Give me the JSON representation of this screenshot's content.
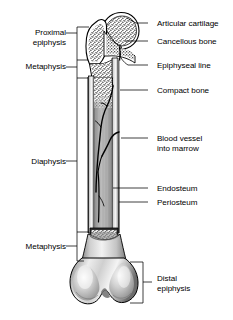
{
  "figure": {
    "width": 233,
    "height": 320,
    "background_color": "#ffffff",
    "ink_color": "#000000"
  },
  "labels_left": [
    {
      "id": "proximal-epiphysis",
      "line1": "Proximal",
      "line2": "epiphysis",
      "text_x": 71,
      "text_y": 28,
      "bracket": {
        "x": 77,
        "y_top": 27,
        "y_bottom": 60,
        "tick_y": 33,
        "tick_x2": 89
      }
    },
    {
      "id": "metaphysis-proximal",
      "line1": "Metaphysis",
      "line2": "",
      "text_x": 71,
      "text_y": 62,
      "bracket": {
        "x": 77,
        "y_top": 60,
        "y_bottom": 78,
        "tick_y": 67,
        "tick_x2": 88
      }
    },
    {
      "id": "diaphysis",
      "line1": "Diaphysis",
      "line2": "",
      "text_x": 71,
      "text_y": 157,
      "bracket": {
        "x": 77,
        "y_top": 78,
        "y_bottom": 232,
        "tick_y": 161,
        "tick_x2": 88
      }
    },
    {
      "id": "metaphysis-distal",
      "line1": "Metaphysis",
      "line2": "",
      "text_x": 71,
      "text_y": 242,
      "bracket": {
        "x": 77,
        "y_top": 232,
        "y_bottom": 261,
        "tick_y": 246,
        "tick_x2": 89
      }
    }
  ],
  "labels_right": [
    {
      "id": "articular-cartilage",
      "line1": "Articular cartilage",
      "line2": "",
      "text_x": 157,
      "text_y": 19,
      "leader": {
        "x1": 148,
        "y1": 23,
        "x2": 127,
        "y2": 19
      }
    },
    {
      "id": "cancellous-bone",
      "line1": "Cancellous bone",
      "line2": "",
      "text_x": 157,
      "text_y": 37,
      "leader": {
        "x1": 148,
        "y1": 41,
        "x2": 124,
        "y2": 41
      }
    },
    {
      "id": "epiphyseal-line",
      "line1": "Epiphyseal line",
      "line2": "",
      "text_x": 157,
      "text_y": 61,
      "leader": {
        "x1": 148,
        "y1": 65,
        "x2": 117,
        "y2": 52
      }
    },
    {
      "id": "compact-bone",
      "line1": "Compact bone",
      "line2": "",
      "text_x": 157,
      "text_y": 86,
      "leader": {
        "x1": 148,
        "y1": 90,
        "x2": 116,
        "y2": 90
      }
    },
    {
      "id": "blood-vessel-into-marrow",
      "line1": "Blood vessel",
      "line2": "into marrow",
      "text_x": 157,
      "text_y": 134,
      "leader": {
        "x1": 148,
        "y1": 138,
        "x2": 119,
        "y2": 138
      }
    },
    {
      "id": "endosteum",
      "line1": "Endosteum",
      "line2": "",
      "text_x": 157,
      "text_y": 184,
      "leader": {
        "x1": 148,
        "y1": 188,
        "x2": 113,
        "y2": 188
      }
    },
    {
      "id": "periosteum",
      "line1": "Periosteum",
      "line2": "",
      "text_x": 157,
      "text_y": 198,
      "leader": {
        "x1": 148,
        "y1": 202,
        "x2": 118,
        "y2": 202
      }
    },
    {
      "id": "distal-epiphysis",
      "line1": "Distal",
      "line2": "epiphysis",
      "text_x": 157,
      "text_y": 274,
      "bracket": {
        "x": 143,
        "y_top": 262,
        "y_bottom": 303,
        "tick_y": 282,
        "tick_x2": 152
      }
    }
  ],
  "anatomy_regions": [
    {
      "id": "femoral-head",
      "name": "Femoral head (proximal epiphysis)",
      "fill": "cancellous-stipple"
    },
    {
      "id": "greater-trochanter",
      "name": "Greater trochanter",
      "fill": "cancellous-stipple"
    },
    {
      "id": "neck",
      "name": "Femoral neck",
      "fill": "cancellous-stipple"
    },
    {
      "id": "shaft",
      "name": "Diaphysis shaft",
      "fill": "compact-bone-gray"
    },
    {
      "id": "medullary-cavity",
      "name": "Medullary cavity / marrow",
      "fill": "marrow-gray"
    },
    {
      "id": "distal-condyles",
      "name": "Distal condyles (distal epiphysis)",
      "fill": "smooth-gray"
    },
    {
      "id": "blood-vessel",
      "name": "Nutrient blood vessel",
      "fill": "black-line"
    }
  ],
  "colors": {
    "ink": "#000000",
    "compact_bone": "#b9b9b9",
    "marrow": "#a8a8a8",
    "cancellous_light": "#ffffff",
    "condyle_light": "#f2f2f2",
    "condyle_mid": "#b4b4b4",
    "condyle_dark": "#8a8a8a"
  }
}
